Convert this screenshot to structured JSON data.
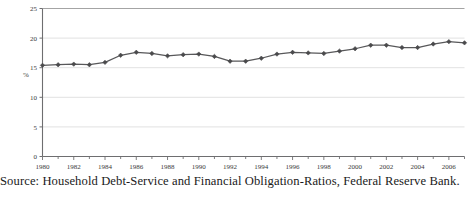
{
  "caption": "Source: Household Debt-Service and Financial Obligation-Ratios, Federal Reserve Bank.",
  "colors": {
    "line": "#58585a",
    "marker": "#4a4a4c",
    "axis": "#6e6e70",
    "grid": "#d9d9d9",
    "text": "#3a3a3a",
    "background": "#ffffff"
  },
  "chart_data": {
    "type": "line",
    "title": "",
    "xlabel": "",
    "ylabel": "%",
    "xlim": [
      1980,
      2007
    ],
    "ylim": [
      0,
      25
    ],
    "yticks": [
      0,
      5,
      10,
      15,
      20,
      25
    ],
    "ytick_labels": [
      "0",
      "5",
      "10",
      "15",
      "20",
      "25"
    ],
    "xticks": [
      1980,
      1982,
      1984,
      1986,
      1988,
      1990,
      1992,
      1994,
      1996,
      1998,
      2000,
      2002,
      2004,
      2006
    ],
    "xtick_labels": [
      "1980",
      "1982",
      "1984",
      "1986",
      "1988",
      "1990",
      "1992",
      "1994",
      "1996",
      "1998",
      "2000",
      "2002",
      "2004",
      "2006"
    ],
    "minor_xticks_every": 1,
    "grid": "horizontal",
    "legend": "none",
    "marker": "diamond",
    "x": [
      1980,
      1981,
      1982,
      1983,
      1984,
      1985,
      1986,
      1987,
      1988,
      1989,
      1990,
      1991,
      1992,
      1993,
      1994,
      1995,
      1996,
      1997,
      1998,
      1999,
      2000,
      2001,
      2002,
      2003,
      2004,
      2005,
      2006,
      2007
    ],
    "values": [
      15.4,
      15.5,
      15.6,
      15.5,
      15.9,
      17.1,
      17.6,
      17.4,
      17.0,
      17.2,
      17.3,
      16.9,
      16.1,
      16.1,
      16.6,
      17.3,
      17.6,
      17.5,
      17.4,
      17.8,
      18.2,
      18.8,
      18.8,
      18.4,
      18.4,
      19.0,
      19.4,
      19.2
    ],
    "series_name": "Household Debt-Service and Financial Obligation Ratio"
  }
}
